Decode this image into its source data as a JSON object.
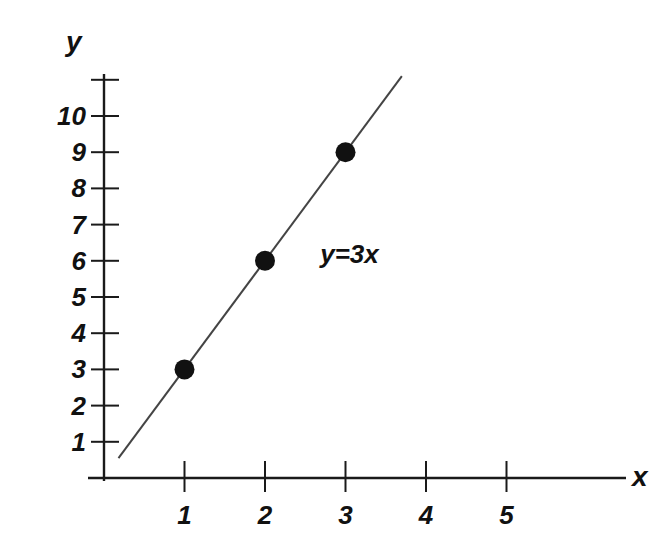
{
  "chart_data": {
    "type": "line",
    "title": "",
    "subtitle": "",
    "xlabel": "x",
    "ylabel": "y",
    "x": [
      1,
      2,
      3
    ],
    "values": [
      3,
      6,
      9
    ],
    "series": [
      {
        "name": "y=3x",
        "x": [
          1,
          2,
          3
        ],
        "values": [
          3,
          6,
          9
        ]
      }
    ],
    "points": [
      {
        "x": 1,
        "y": 3
      },
      {
        "x": 2,
        "y": 6
      },
      {
        "x": 3,
        "y": 9
      }
    ],
    "annotations": [
      {
        "text": "y=3x",
        "x": 3.05,
        "y": 6.2
      }
    ],
    "equation": "y=3x",
    "slope": 3,
    "intercept": 0,
    "line_from": {
      "x": 0.18,
      "y": 0.55
    },
    "line_to": {
      "x": 3.7,
      "y": 11.1
    },
    "xlim": [
      0,
      6.75
    ],
    "ylim": [
      0,
      11.5
    ],
    "xticks": [
      1,
      2,
      3,
      4,
      5
    ],
    "yticks": [
      1,
      2,
      3,
      4,
      5,
      6,
      7,
      8,
      9,
      10
    ],
    "xtick_labels": [
      "1",
      "2",
      "3",
      "4",
      "5"
    ],
    "ytick_labels": [
      "1",
      "2",
      "3",
      "4",
      "5",
      "6",
      "7",
      "8",
      "9",
      "10"
    ],
    "extra_unlabeled_yticks": [
      11
    ],
    "grid": false,
    "legend": false,
    "legend_position": "none",
    "marker": "filled-circle",
    "marker_color": "#111111",
    "line_color": "#444444",
    "axis_color": "#1a1a1a",
    "background_color": "#ffffff"
  },
  "axes": {
    "x_name": "x",
    "y_name": "y"
  }
}
